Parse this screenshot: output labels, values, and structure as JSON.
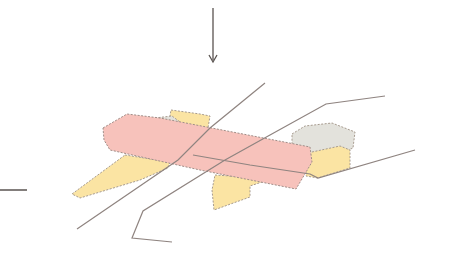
{
  "diagram": {
    "type": "axonometric-site-diagram",
    "colors": {
      "background": "#ffffff",
      "main_volume": "#f7c2bb",
      "wing_volumes": "#fbe4a3",
      "grey_volume": "#e3e2dc",
      "outline": "#9a8f8a",
      "paths": "#8f8480",
      "arrows": "#5a5350"
    },
    "elements": [
      {
        "id": "arrow-north",
        "kind": "arrow",
        "direction": "down"
      },
      {
        "id": "arrow-west",
        "kind": "line",
        "direction": "horizontal"
      },
      {
        "id": "main-volume",
        "kind": "volume",
        "fill": "pink"
      },
      {
        "id": "wing-left",
        "kind": "volume",
        "fill": "yellow"
      },
      {
        "id": "wing-top",
        "kind": "volume",
        "fill": "yellow"
      },
      {
        "id": "wing-bottom",
        "kind": "volume",
        "fill": "yellow"
      },
      {
        "id": "wing-right",
        "kind": "volume",
        "fill": "yellow"
      },
      {
        "id": "grey-block",
        "kind": "volume",
        "fill": "grey"
      },
      {
        "id": "path-a",
        "kind": "path-line"
      },
      {
        "id": "path-b",
        "kind": "path-line"
      },
      {
        "id": "path-c",
        "kind": "path-line"
      }
    ]
  }
}
